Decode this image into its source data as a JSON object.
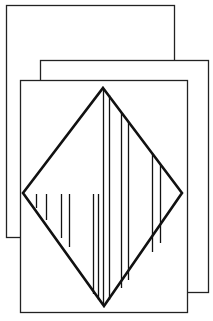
{
  "figure": {
    "stroke_color": "#111111",
    "background": "#ffffff",
    "cards": [
      {
        "name": "back-card",
        "x": 6,
        "y": 5,
        "w": 168,
        "h": 232
      },
      {
        "name": "middle-card",
        "x": 40,
        "y": 60,
        "w": 168,
        "h": 232
      },
      {
        "name": "front-card",
        "x": 20,
        "y": 80,
        "w": 167,
        "h": 232
      }
    ],
    "diamond": {
      "top": [
        103,
        88
      ],
      "right": [
        182,
        193
      ],
      "bottom": [
        104,
        306
      ],
      "left": [
        23,
        193
      ]
    }
  }
}
